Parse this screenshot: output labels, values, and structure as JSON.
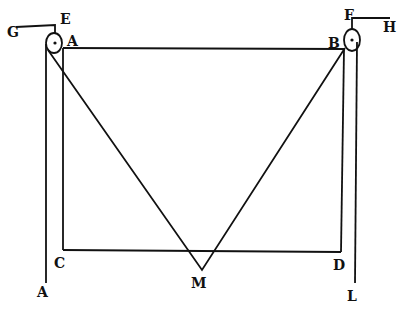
{
  "diagram": {
    "labels": {
      "G": "G",
      "E": "E",
      "A_top": "A",
      "B": "B",
      "F": "F",
      "H": "H",
      "C": "C",
      "D": "D",
      "M": "M",
      "A_bottom": "A",
      "L": "L"
    },
    "colors": {
      "ink": "#111111",
      "paper": "#ffffff"
    }
  }
}
